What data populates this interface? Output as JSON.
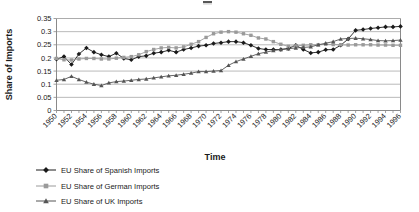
{
  "chart_data": {
    "type": "line",
    "title": "",
    "xlabel": "Time",
    "ylabel": "Share of Imports",
    "ylim": [
      0,
      0.35
    ],
    "ytick_labels": [
      "0",
      "0.05",
      "0.1",
      "0.15",
      "0.2",
      "0.25",
      "0.3",
      "0.35"
    ],
    "ytick_values": [
      0,
      0.05,
      0.1,
      0.15,
      0.2,
      0.25,
      0.3,
      0.35
    ],
    "grid": true,
    "legend_position": "bottom-left",
    "x": [
      1950,
      1951,
      1952,
      1953,
      1954,
      1955,
      1956,
      1957,
      1958,
      1959,
      1960,
      1961,
      1962,
      1963,
      1964,
      1965,
      1966,
      1967,
      1968,
      1969,
      1970,
      1971,
      1972,
      1973,
      1974,
      1975,
      1976,
      1977,
      1978,
      1979,
      1980,
      1981,
      1982,
      1983,
      1984,
      1985,
      1986,
      1987,
      1988,
      1989,
      1990,
      1991,
      1992,
      1993,
      1994,
      1995,
      1996
    ],
    "xtick_labels": [
      "1950",
      "1952",
      "1954",
      "1956",
      "1958",
      "1960",
      "1962",
      "1964",
      "1966",
      "1968",
      "1970",
      "1972",
      "1974",
      "1976",
      "1978",
      "1980",
      "1982",
      "1984",
      "1986",
      "1988",
      "1990",
      "1992",
      "1994",
      "1996"
    ],
    "series": [
      {
        "name": "EU Share of Spanish Imports",
        "marker": "diamond",
        "color": "#1a1a1a",
        "values": [
          0.195,
          0.205,
          0.175,
          0.215,
          0.238,
          0.222,
          0.212,
          0.205,
          0.218,
          0.198,
          0.193,
          0.205,
          0.208,
          0.218,
          0.222,
          0.229,
          0.222,
          0.232,
          0.238,
          0.245,
          0.248,
          0.255,
          0.258,
          0.262,
          0.262,
          0.258,
          0.248,
          0.236,
          0.232,
          0.232,
          0.232,
          0.236,
          0.248,
          0.232,
          0.219,
          0.222,
          0.231,
          0.232,
          0.248,
          0.272,
          0.305,
          0.308,
          0.312,
          0.315,
          0.318,
          0.318,
          0.32
        ]
      },
      {
        "name": "EU Share of German Imports",
        "marker": "square",
        "color": "#9a9a9a",
        "values": [
          0.198,
          0.193,
          0.192,
          0.196,
          0.198,
          0.198,
          0.196,
          0.196,
          0.199,
          0.202,
          0.205,
          0.212,
          0.224,
          0.232,
          0.238,
          0.24,
          0.238,
          0.242,
          0.252,
          0.262,
          0.278,
          0.292,
          0.298,
          0.3,
          0.298,
          0.292,
          0.286,
          0.276,
          0.272,
          0.262,
          0.252,
          0.244,
          0.246,
          0.248,
          0.25,
          0.25,
          0.252,
          0.251,
          0.25,
          0.249,
          0.25,
          0.25,
          0.25,
          0.249,
          0.249,
          0.248,
          0.248
        ]
      },
      {
        "name": "EU Share of UK Imports",
        "marker": "triangle",
        "color": "#555555",
        "values": [
          0.115,
          0.118,
          0.13,
          0.118,
          0.108,
          0.1,
          0.095,
          0.105,
          0.11,
          0.112,
          0.115,
          0.118,
          0.12,
          0.124,
          0.128,
          0.132,
          0.134,
          0.138,
          0.142,
          0.148,
          0.148,
          0.15,
          0.152,
          0.172,
          0.186,
          0.196,
          0.206,
          0.216,
          0.222,
          0.228,
          0.232,
          0.235,
          0.238,
          0.24,
          0.242,
          0.25,
          0.256,
          0.262,
          0.272,
          0.274,
          0.275,
          0.273,
          0.27,
          0.266,
          0.265,
          0.266,
          0.268
        ]
      }
    ]
  },
  "legend": {
    "items": [
      {
        "label": "EU Share of Spanish Imports",
        "marker": "diamond",
        "color": "#1a1a1a"
      },
      {
        "label": "EU Share of German Imports",
        "marker": "square",
        "color": "#9a9a9a"
      },
      {
        "label": "EU Share of UK Imports",
        "marker": "triangle",
        "color": "#555555"
      }
    ]
  }
}
